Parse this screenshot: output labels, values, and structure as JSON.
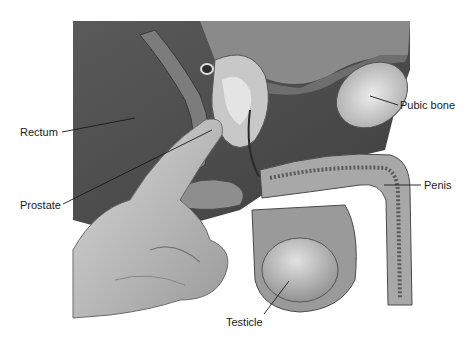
{
  "diagram": {
    "labels": [
      {
        "id": "rectum",
        "text": "Rectum",
        "x": 20,
        "y": 126,
        "line": [
          62,
          132,
          135,
          118
        ]
      },
      {
        "id": "prostate",
        "text": "Prostate",
        "x": 20,
        "y": 199,
        "line": [
          63,
          204,
          212,
          130
        ]
      },
      {
        "id": "pubic_bone",
        "text": "Pubic bone",
        "x": 399,
        "y": 99,
        "line": [
          398,
          105,
          370,
          96
        ]
      },
      {
        "id": "penis",
        "text": "Penis",
        "x": 423,
        "y": 180,
        "line": [
          421,
          185,
          384,
          185
        ]
      },
      {
        "id": "testicle",
        "text": "Testicle",
        "x": 225,
        "y": 316,
        "line": [
          264,
          314,
          289,
          281
        ]
      }
    ]
  }
}
